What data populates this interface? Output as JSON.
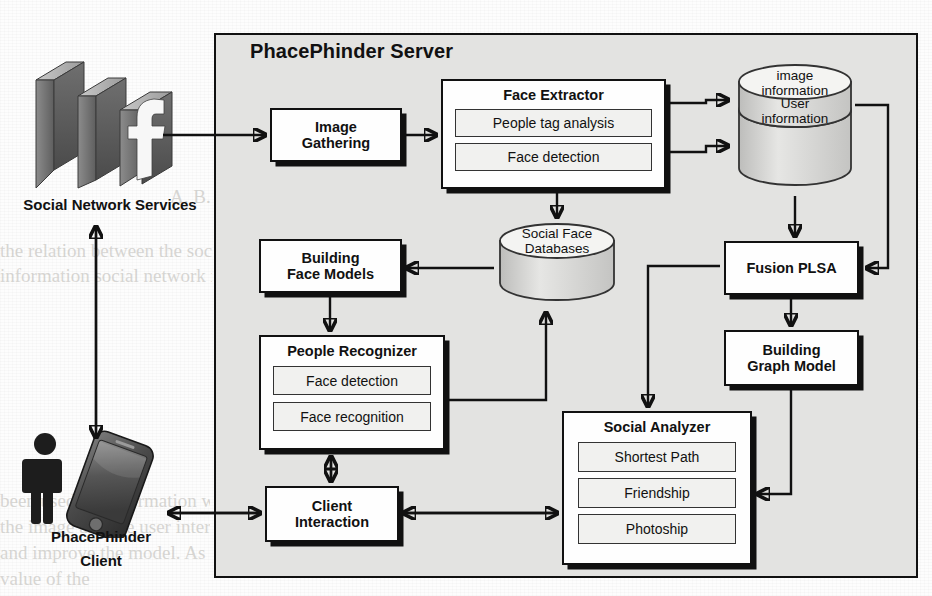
{
  "diagram": {
    "server_panel": {
      "title": "PhacePhinder Server"
    },
    "external": [
      {
        "id": "sns",
        "label": "Social Network Services",
        "icon": "facebook-3d-logo"
      },
      {
        "id": "client",
        "label_line1": "PhacePhinder",
        "label_line2": "Client",
        "icon": "person-and-smartphone"
      }
    ],
    "boxes": [
      {
        "id": "image-gathering",
        "title_line1": "Image",
        "title_line2": "Gathering",
        "subs": []
      },
      {
        "id": "face-extractor",
        "title": "Face Extractor",
        "subs": [
          "People tag analysis",
          "Face detection"
        ]
      },
      {
        "id": "building-face-models",
        "title_line1": "Building",
        "title_line2": "Face Models",
        "subs": []
      },
      {
        "id": "people-recognizer",
        "title": "People Recognizer",
        "subs": [
          "Face detection",
          "Face recognition"
        ]
      },
      {
        "id": "client-interaction",
        "title_line1": "Client",
        "title_line2": "Interaction",
        "subs": []
      },
      {
        "id": "fusion-plsa",
        "title": "Fusion PLSA",
        "subs": []
      },
      {
        "id": "building-graph-model",
        "title_line1": "Building",
        "title_line2": "Graph Model",
        "subs": []
      },
      {
        "id": "social-analyzer",
        "title": "Social Analyzer",
        "subs": [
          "Shortest Path",
          "Friendship",
          "Photoship"
        ]
      }
    ],
    "datastores": [
      {
        "id": "image-user-info",
        "top_label_line1": "image",
        "top_label_line2": "information",
        "bottom_label_line1": "User",
        "bottom_label_line2": "information"
      },
      {
        "id": "social-face-databases",
        "label_line1": "Social Face",
        "label_line2": "Databases"
      }
    ],
    "colors": {
      "panel_fill": "#e3e3e1",
      "box_fill": "#fefefe",
      "sub_fill": "#f1f1ef",
      "stroke": "#111111",
      "cylinder_fill": "#d9d9d7",
      "page": "#fdfdfd"
    },
    "background_text": [
      "A. B. C. D. E. F. G. H. I. J. K. L. M.",
      "the relation between the social network and the model",
      "information social network is a set of connections",
      "been used for information we have been using",
      "the image and the user interaction to the analyzer",
      "and improve the model. As a result, we consider the",
      "value of the"
    ]
  }
}
